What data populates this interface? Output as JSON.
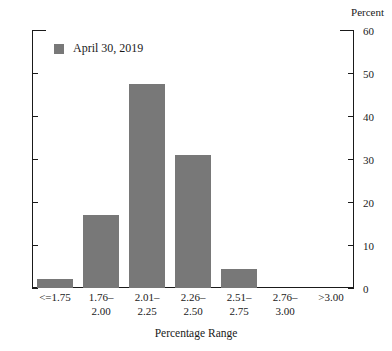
{
  "chart_data": {
    "type": "bar",
    "title": "",
    "subtitle": "",
    "xlabel": "Percentage Range",
    "ylabel": "Percent",
    "categories": [
      "<=1.75",
      "1.76–\n2.00",
      "2.01–\n2.25",
      "2.26–\n2.50",
      "2.51–\n2.75",
      "2.76–\n3.00",
      ">3.00"
    ],
    "category_lines": [
      {
        "line1": "<=1.75",
        "line2": ""
      },
      {
        "line1": "1.76–",
        "line2": "2.00"
      },
      {
        "line1": "2.01–",
        "line2": "2.25"
      },
      {
        "line1": "2.26–",
        "line2": "2.50"
      },
      {
        "line1": "2.51–",
        "line2": "2.75"
      },
      {
        "line1": "2.76–",
        "line2": "3.00"
      },
      {
        "line1": ">3.00",
        "line2": ""
      }
    ],
    "series": [
      {
        "name": "April 30, 2019",
        "color": "#787878",
        "values": [
          2,
          17,
          47.5,
          31,
          4.5,
          0,
          0
        ]
      }
    ],
    "ylim": [
      0,
      60
    ],
    "yticks": [
      0,
      10,
      20,
      30,
      40,
      50,
      60
    ],
    "ytick_labels": [
      "0",
      "10",
      "20",
      "30",
      "40",
      "50",
      "60"
    ],
    "ytick_side": "right",
    "grid": false,
    "legend_position": "top-left-inside"
  },
  "legend": {
    "entries": [
      {
        "label": "April 30, 2019",
        "color": "#787878"
      }
    ]
  },
  "axis": {
    "unit_label": "Percent"
  },
  "colors": {
    "bar": "#787878",
    "axis": "#1a1a1a",
    "background": "#ffffff"
  }
}
